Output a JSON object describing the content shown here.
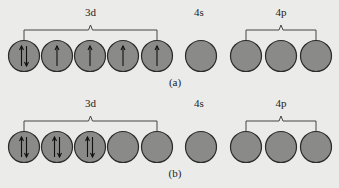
{
  "panels": [
    {
      "caption": "(a)",
      "groups": [
        {
          "label": "3d",
          "orbitals": [
            "up-down",
            "up",
            "up",
            "up",
            "up"
          ],
          "bracket": true
        },
        {
          "label": "4s",
          "orbitals": [
            "empty"
          ],
          "bracket": false
        },
        {
          "label": "4p",
          "orbitals": [
            "empty",
            "empty",
            "empty"
          ],
          "bracket": true
        }
      ]
    },
    {
      "caption": "(b)",
      "groups": [
        {
          "label": "3d",
          "orbitals": [
            "up-down",
            "up-down",
            "up-down",
            "empty",
            "empty"
          ],
          "bracket": true
        },
        {
          "label": "4s",
          "orbitals": [
            "empty"
          ],
          "bracket": false
        },
        {
          "label": "4p",
          "orbitals": [
            "empty",
            "empty",
            "empty"
          ],
          "bracket": true
        }
      ]
    }
  ],
  "colors": {
    "orbital_fill": "#8a8a88",
    "background": "#ebebe9"
  }
}
